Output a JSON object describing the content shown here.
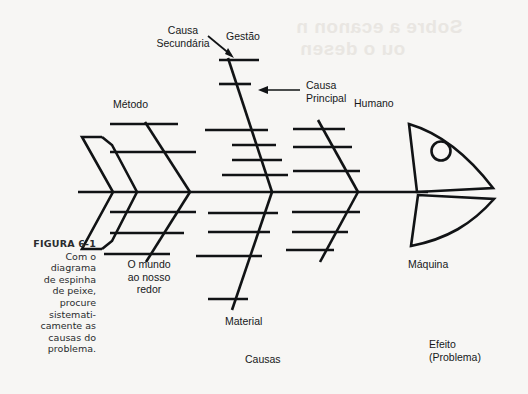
{
  "figure": {
    "number": "FIGURA 6-1",
    "caption_lines": [
      "Com o",
      "diagrama",
      "de espinha",
      "de peixe,",
      "procure",
      "sistemati-",
      "camente as",
      "causas do",
      "problema."
    ],
    "caption_text": "Com o diagrama de espinha de peixe, procure sistematicamente as causas do problema."
  },
  "diagram": {
    "type": "fishbone-ishikawa-diagram",
    "title": "Diagrama de espinha de peixe",
    "line_color": "#111315",
    "background_color": "#f7f6f4",
    "annotations": {
      "secondary_cause": {
        "line1": "Causa",
        "line2": "Secundária",
        "points_to": "sub-bone of the Gestão branch"
      },
      "primary_cause": {
        "line1": "Causa",
        "line2": "Principal",
        "points_to": "main branch rib of Gestão"
      }
    },
    "categories": [
      {
        "id": "gestao",
        "label": "Gestão",
        "side": "top",
        "position": 1,
        "sub_causes": 2
      },
      {
        "id": "metodo",
        "label": "Método",
        "side": "top",
        "position": 2,
        "sub_causes": 2
      },
      {
        "id": "humano",
        "label": "Humano",
        "side": "top",
        "position": 3,
        "sub_causes": 3
      },
      {
        "id": "mundo",
        "label": "O mundo ao nosso redor",
        "label_lines": [
          "O mundo",
          "ao nosso",
          "redor"
        ],
        "side": "bottom",
        "position": 1,
        "sub_causes": 3
      },
      {
        "id": "material",
        "label": "Material",
        "side": "bottom",
        "position": 2,
        "sub_causes": 4
      },
      {
        "id": "maquina",
        "label": "Máquina",
        "side": "bottom",
        "position": 3,
        "sub_causes": 3
      }
    ],
    "spine_label": "Causas",
    "effect": {
      "line1": "Efeito",
      "line2": "(Problema)",
      "text": "Efeito (Problema)"
    },
    "fish": {
      "head_shape": "two curved fins forming a head",
      "eye": "circle",
      "tail_shape": "open chevron outline"
    }
  },
  "ghost_text": {
    "line1": "Sobre a ecanon n",
    "line2": "ou o desen"
  }
}
